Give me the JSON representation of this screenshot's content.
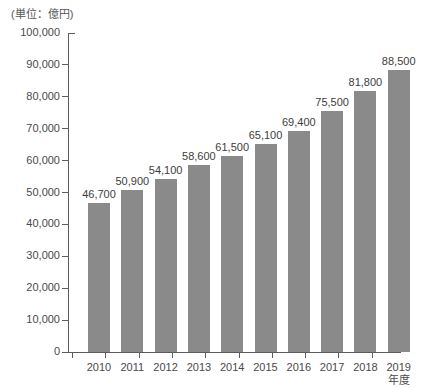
{
  "unit_caption": "(単位：億円)",
  "colors": {
    "bar": "#8a8a8a",
    "axis": "#5c5c5c",
    "text": "#4a4a4a",
    "background": "#ffffff"
  },
  "chart_data": {
    "type": "bar",
    "title": "",
    "subtitle": "",
    "xlabel": "年度",
    "ylabel": "",
    "unit": "(単位：億円)",
    "categories": [
      "2010",
      "2011",
      "2012",
      "2013",
      "2014",
      "2015",
      "2016",
      "2017",
      "2018",
      "2019"
    ],
    "values": [
      46700,
      50900,
      54100,
      58600,
      61500,
      65100,
      69400,
      75500,
      81800,
      88500
    ],
    "value_labels": [
      "46,700",
      "50,900",
      "54,100",
      "58,600",
      "61,500",
      "65,100",
      "69,400",
      "75,500",
      "81,800",
      "88,500"
    ],
    "ylim": [
      0,
      100000
    ],
    "ytick_values": [
      0,
      10000,
      20000,
      30000,
      40000,
      50000,
      60000,
      70000,
      80000,
      90000,
      100000
    ],
    "ytick_labels": [
      "0",
      "10,000",
      "20,000",
      "30,000",
      "40,000",
      "50,000",
      "60,000",
      "70,000",
      "80,000",
      "90,000",
      "100,000"
    ],
    "grid": false,
    "legend": null,
    "legend_position": "none",
    "series": [
      {
        "name": "",
        "values": [
          46700,
          50900,
          54100,
          58600,
          61500,
          65100,
          69400,
          75500,
          81800,
          88500
        ]
      }
    ]
  }
}
